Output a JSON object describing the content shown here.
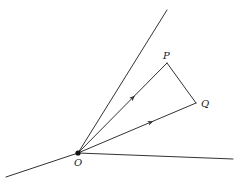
{
  "diagram": {
    "type": "vector-geometry",
    "colors": {
      "stroke": "#333333",
      "label": "#222222",
      "background": "#ffffff"
    },
    "points": {
      "O": {
        "label": "O",
        "x": 78,
        "y": 153
      },
      "P": {
        "label": "P",
        "x": 167,
        "y": 63
      },
      "Q": {
        "label": "Q",
        "x": 196,
        "y": 103
      }
    },
    "lines": [
      {
        "name": "upper-ray",
        "x1": 78,
        "y1": 153,
        "x2": 167,
        "y2": 10
      },
      {
        "name": "lower-left-ray",
        "x1": 6,
        "y1": 177,
        "x2": 78,
        "y2": 153
      },
      {
        "name": "right-ray",
        "x1": 78,
        "y1": 153,
        "x2": 233,
        "y2": 159
      }
    ],
    "vectors": [
      {
        "name": "vector-OP",
        "from": "O",
        "to": "P",
        "arrow_at": 0.64
      },
      {
        "name": "vector-OQ",
        "from": "O",
        "to": "Q",
        "arrow_at": 0.64
      }
    ],
    "segments": [
      {
        "name": "segment-PQ",
        "from": "P",
        "to": "Q"
      }
    ]
  }
}
